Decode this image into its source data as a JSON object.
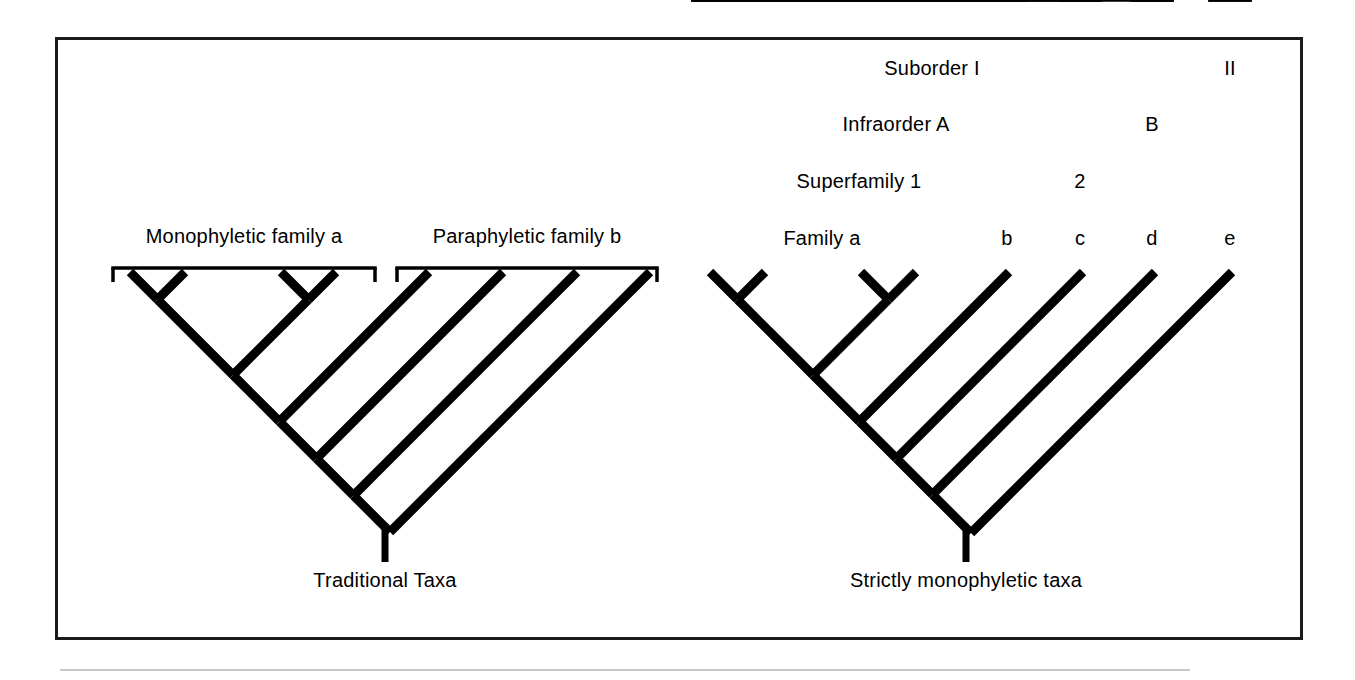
{
  "figure": {
    "kind": "cladogram-comparison",
    "background_color": "#ffffff",
    "ink_color": "#000000",
    "frame_color": "#1a1a1a",
    "rule_color": "#9a9a9a"
  },
  "left_panel": {
    "caption": "Traditional Taxa",
    "brackets": [
      {
        "id": "mono-a",
        "label": "Monophyletic family a",
        "x1": 113,
        "x2": 375,
        "y": 268,
        "label_x": 244,
        "label_y": 226
      },
      {
        "id": "para-b",
        "label": "Paraphyletic family b",
        "x1": 397,
        "x2": 657,
        "y": 268,
        "label_x": 527,
        "label_y": 226
      }
    ],
    "tree": {
      "tip_count": 8,
      "tip_xs": [
        130,
        185,
        281,
        336,
        429,
        503,
        577,
        650
      ],
      "tip_y": 272,
      "root_x": 385,
      "root_y": 530,
      "stem_bottom_y": 562
    },
    "caption_x": 385,
    "caption_y": 570
  },
  "right_panel": {
    "caption": "Strictly monophyletic taxa",
    "bracket_rows": [
      {
        "row": "suborder",
        "row_label_prefix": "Suborder",
        "y": 96,
        "label_y": 58,
        "items": [
          {
            "label": "Suborder I",
            "x1": 693,
            "x2": 1172,
            "label_x": 932,
            "label_y": 58
          },
          {
            "label": "II",
            "x1": 1210,
            "x2": 1250,
            "label_x": 1230,
            "label_y": 58
          }
        ]
      },
      {
        "row": "infraorder",
        "row_label_prefix": "Infraorder",
        "y": 152,
        "label_y": 114,
        "items": [
          {
            "label": "Infraorder A",
            "x1": 693,
            "x2": 1100,
            "label_x": 896,
            "label_y": 114
          },
          {
            "label": "B",
            "x1": 1132,
            "x2": 1172,
            "label_x": 1152,
            "label_y": 114
          }
        ]
      },
      {
        "row": "superfamily",
        "row_label_prefix": "Superfamily",
        "y": 209,
        "label_y": 171,
        "items": [
          {
            "label": "Superfamily 1",
            "x1": 693,
            "x2": 1026,
            "label_x": 859,
            "label_y": 171
          },
          {
            "label": "2",
            "x1": 1060,
            "x2": 1100,
            "label_x": 1080,
            "label_y": 171
          }
        ]
      },
      {
        "row": "family",
        "row_label_prefix": "Family",
        "y": 268,
        "label_y": 228,
        "items": [
          {
            "label": "Family a",
            "x1": 693,
            "x2": 953,
            "label_x": 822,
            "label_y": 228
          },
          {
            "label": "b",
            "x1": 988,
            "x2": 1026,
            "label_x": 1007,
            "label_y": 228
          },
          {
            "label": "c",
            "x1": 1060,
            "x2": 1100,
            "label_x": 1080,
            "label_y": 228
          },
          {
            "label": "d",
            "x1": 1132,
            "x2": 1172,
            "label_x": 1152,
            "label_y": 228
          },
          {
            "label": "e",
            "x1": 1210,
            "x2": 1250,
            "label_x": 1230,
            "label_y": 228
          }
        ]
      }
    ],
    "tree": {
      "tip_count": 8,
      "tip_xs": [
        710,
        765,
        861,
        916,
        1009,
        1083,
        1155,
        1232
      ],
      "tip_y": 272,
      "root_x": 966,
      "root_y": 530,
      "stem_bottom_y": 562
    },
    "caption_x": 966,
    "caption_y": 570
  }
}
